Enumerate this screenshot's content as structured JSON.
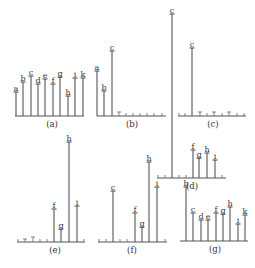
{
  "figure": {
    "panels": [
      {
        "id": "a",
        "caption": "(a)",
        "baseline_y": 116,
        "x_start": 15,
        "x_end": 84,
        "caption_x": 52,
        "stems": [
          {
            "label": "a",
            "x": 16,
            "top": 92
          },
          {
            "label": "b",
            "x": 23,
            "top": 82
          },
          {
            "label": "c",
            "x": 31,
            "top": 76
          },
          {
            "label": "d",
            "x": 38,
            "top": 84
          },
          {
            "label": "e",
            "x": 45,
            "top": 79
          },
          {
            "label": "f",
            "x": 53,
            "top": 84
          },
          {
            "label": "g",
            "x": 60,
            "top": 77
          },
          {
            "label": "h",
            "x": 68,
            "top": 96
          },
          {
            "label": "i",
            "x": 75,
            "top": 78
          },
          {
            "label": "k",
            "x": 83,
            "top": 78
          }
        ],
        "small_ticks": []
      },
      {
        "id": "b",
        "caption": "(b)",
        "baseline_y": 116,
        "x_start": 97,
        "x_end": 166,
        "caption_x": 132,
        "stems": [
          {
            "label": "a",
            "x": 97,
            "top": 71
          },
          {
            "label": "b",
            "x": 104,
            "top": 91
          },
          {
            "label": "c",
            "x": 112,
            "top": 51
          }
        ],
        "small_ticks": [
          {
            "x": 119,
            "h": 4,
            "cap": true
          },
          {
            "x": 126,
            "h": 3
          },
          {
            "x": 133,
            "h": 3
          },
          {
            "x": 140,
            "h": 3
          },
          {
            "x": 147,
            "h": 3
          },
          {
            "x": 154,
            "h": 3
          },
          {
            "x": 162,
            "h": 3
          }
        ]
      },
      {
        "id": "c",
        "caption": "(c)",
        "baseline_y": 116,
        "x_start": 178,
        "x_end": 246,
        "caption_x": 213,
        "stems": [
          {
            "label": "c",
            "x": 192,
            "top": 48
          }
        ],
        "small_ticks": [
          {
            "x": 179,
            "h": 3
          },
          {
            "x": 185,
            "h": 3
          },
          {
            "x": 200,
            "h": 4,
            "cap": true
          },
          {
            "x": 207,
            "h": 3
          },
          {
            "x": 214,
            "h": 4,
            "cap": true
          },
          {
            "x": 222,
            "h": 3
          },
          {
            "x": 229,
            "h": 4,
            "cap": true
          },
          {
            "x": 237,
            "h": 3
          },
          {
            "x": 244,
            "h": 3
          }
        ]
      },
      {
        "id": "d",
        "caption": "(d)",
        "baseline_y": 178,
        "x_start": 157,
        "x_end": 226,
        "caption_x": 192,
        "stems": [
          {
            "label": "c",
            "x": 172,
            "top": 14
          },
          {
            "label": "f",
            "x": 193,
            "top": 150
          },
          {
            "label": "g",
            "x": 199,
            "top": 158
          },
          {
            "label": "h",
            "x": 207,
            "top": 153
          },
          {
            "label": "i",
            "x": 215,
            "top": 160
          }
        ],
        "small_ticks": [
          {
            "x": 158,
            "h": 3
          },
          {
            "x": 165,
            "h": 3
          },
          {
            "x": 179,
            "h": 3
          },
          {
            "x": 186,
            "h": 3
          },
          {
            "x": 222,
            "h": 3
          }
        ]
      },
      {
        "id": "e",
        "caption": "(e)",
        "baseline_y": 242,
        "x_start": 17,
        "x_end": 85,
        "caption_x": 55,
        "stems": [
          {
            "label": "f",
            "x": 54,
            "top": 209
          },
          {
            "label": "g",
            "x": 61,
            "top": 229
          },
          {
            "label": "h",
            "x": 69,
            "top": 142
          },
          {
            "label": "i",
            "x": 77,
            "top": 206
          }
        ],
        "small_ticks": [
          {
            "x": 18,
            "h": 3
          },
          {
            "x": 25,
            "h": 3,
            "cap": true
          },
          {
            "x": 33,
            "h": 5,
            "cap": true
          },
          {
            "x": 40,
            "h": 3
          },
          {
            "x": 47,
            "h": 3
          },
          {
            "x": 84,
            "h": 3
          }
        ]
      },
      {
        "id": "f",
        "caption": "(f)",
        "baseline_y": 242,
        "x_start": 98,
        "x_end": 167,
        "caption_x": 132,
        "stems": [
          {
            "label": "c",
            "x": 113,
            "top": 191
          },
          {
            "label": "f",
            "x": 135,
            "top": 213
          },
          {
            "label": "g",
            "x": 142,
            "top": 227
          },
          {
            "label": "h",
            "x": 149,
            "top": 162
          },
          {
            "label": "i",
            "x": 157,
            "top": 187
          }
        ],
        "small_ticks": [
          {
            "x": 99,
            "h": 3
          },
          {
            "x": 106,
            "h": 3
          },
          {
            "x": 120,
            "h": 3
          },
          {
            "x": 127,
            "h": 3
          },
          {
            "x": 165,
            "h": 3
          }
        ]
      },
      {
        "id": "g",
        "caption": "(g)",
        "baseline_y": 241,
        "x_start": 180,
        "x_end": 248,
        "caption_x": 215,
        "stems": [
          {
            "label": "b",
            "x": 186,
            "top": 187
          },
          {
            "label": "c",
            "x": 193,
            "top": 213
          },
          {
            "label": "d",
            "x": 201,
            "top": 220
          },
          {
            "label": "e",
            "x": 208,
            "top": 220
          },
          {
            "label": "f",
            "x": 216,
            "top": 213
          },
          {
            "label": "g",
            "x": 223,
            "top": 214
          },
          {
            "label": "h",
            "x": 230,
            "top": 207
          },
          {
            "label": "i",
            "x": 238,
            "top": 224
          },
          {
            "label": "k",
            "x": 245,
            "top": 215
          }
        ],
        "small_ticks": []
      }
    ]
  }
}
